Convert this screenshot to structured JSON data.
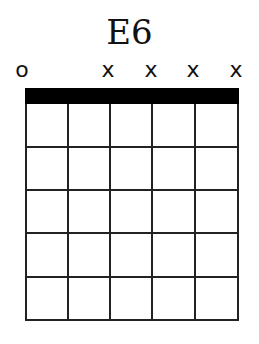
{
  "chord": {
    "name": "E6",
    "strings": [
      {
        "index": 1,
        "marker": "o",
        "x": 26
      },
      {
        "index": 2,
        "marker": "",
        "x": 68
      },
      {
        "index": 3,
        "marker": "x",
        "x": 110
      },
      {
        "index": 4,
        "marker": "x",
        "x": 152
      },
      {
        "index": 5,
        "marker": "x",
        "x": 195
      },
      {
        "index": 6,
        "marker": "x",
        "x": 238
      }
    ],
    "frets_shown": 5,
    "fret_y": [
      147,
      190,
      233,
      277,
      320
    ],
    "colors": {
      "lines": "#222222",
      "nut": "#000000",
      "background": "#ffffff"
    }
  }
}
